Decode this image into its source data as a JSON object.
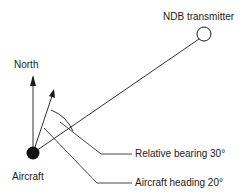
{
  "diagram": {
    "labels": {
      "ndb": "NDB transmitter",
      "north": "North",
      "aircraft": "Aircraft",
      "relative_bearing": "Relative bearing 30°",
      "aircraft_heading": "Aircraft heading 20°"
    },
    "colors": {
      "line": "#1a1a1a",
      "background": "#ffffff"
    }
  }
}
